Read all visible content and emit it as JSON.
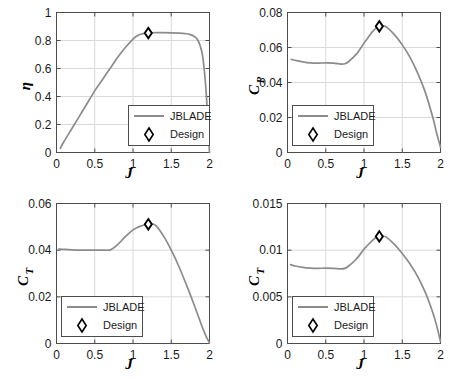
{
  "figure": {
    "title": "",
    "panel_count": 4,
    "series_color": "#8c8c8c",
    "marker_color": "#000000",
    "grid_color": "#d9d9d9",
    "axis_color": "#4d4d4d"
  },
  "legend": {
    "line_label": "JBLADE",
    "marker_label": "Design",
    "marker_icon": "diamond-icon",
    "line_icon": "line-swatch-icon"
  },
  "chart_data": [
    {
      "id": "panel-eta",
      "type": "line",
      "title": "",
      "xlabel": "J",
      "ylabel": "η",
      "ylabel_plain": "eta",
      "xlim": [
        0,
        2
      ],
      "ylim": [
        0,
        1
      ],
      "xticks": [
        0,
        0.5,
        1,
        1.5,
        2
      ],
      "xticklabels": [
        "0",
        "0.5",
        "1",
        "1.5",
        "2"
      ],
      "yticks": [
        0,
        0.2,
        0.4,
        0.6,
        0.8,
        1
      ],
      "yticklabels": [
        "0",
        "0.2",
        "0.4",
        "0.6",
        "0.8",
        "1"
      ],
      "grid": true,
      "legend_position": "lower right",
      "series": [
        {
          "name": "JBLADE",
          "x": [
            0.05,
            0.1,
            0.2,
            0.3,
            0.4,
            0.5,
            0.6,
            0.7,
            0.8,
            0.9,
            1.0,
            1.05,
            1.1,
            1.15,
            1.2,
            1.25,
            1.3,
            1.4,
            1.5,
            1.6,
            1.7,
            1.75,
            1.8,
            1.85,
            1.9,
            1.93,
            1.96,
            1.98,
            2.0
          ],
          "y": [
            0.03,
            0.08,
            0.17,
            0.26,
            0.35,
            0.44,
            0.52,
            0.6,
            0.68,
            0.75,
            0.81,
            0.832,
            0.845,
            0.851,
            0.853,
            0.855,
            0.856,
            0.856,
            0.855,
            0.853,
            0.848,
            0.842,
            0.83,
            0.8,
            0.72,
            0.6,
            0.4,
            0.2,
            0.0
          ]
        }
      ],
      "design_point": {
        "x": 1.2,
        "y": 0.853,
        "label": "Design"
      }
    },
    {
      "id": "panel-cp",
      "type": "line",
      "title": "",
      "xlabel": "J",
      "ylabel": "C_P",
      "ylabel_base": "C",
      "ylabel_sub": "P",
      "xlim": [
        0,
        2
      ],
      "ylim": [
        0,
        0.08
      ],
      "xticks": [
        0,
        0.5,
        1,
        1.5,
        2
      ],
      "xticklabels": [
        "0",
        "0.5",
        "1",
        "1.5",
        "2"
      ],
      "yticks": [
        0,
        0.02,
        0.04,
        0.06,
        0.08
      ],
      "yticklabels": [
        "0",
        "0.02",
        "0.04",
        "0.06",
        "0.08"
      ],
      "grid": true,
      "legend_position": "lower left",
      "series": [
        {
          "name": "JBLADE",
          "x": [
            0.05,
            0.1,
            0.2,
            0.3,
            0.4,
            0.5,
            0.6,
            0.7,
            0.75,
            0.8,
            0.9,
            1.0,
            1.05,
            1.1,
            1.15,
            1.2,
            1.25,
            1.3,
            1.4,
            1.5,
            1.6,
            1.7,
            1.8,
            1.9,
            1.95,
            2.0
          ],
          "y": [
            0.0532,
            0.0527,
            0.0518,
            0.0512,
            0.0511,
            0.0512,
            0.0511,
            0.0505,
            0.0507,
            0.052,
            0.0562,
            0.0625,
            0.0655,
            0.0685,
            0.0708,
            0.0721,
            0.0724,
            0.0715,
            0.0672,
            0.0615,
            0.0545,
            0.0455,
            0.0345,
            0.02,
            0.011,
            0.003
          ]
        }
      ],
      "design_point": {
        "x": 1.2,
        "y": 0.0721,
        "label": "Design"
      }
    },
    {
      "id": "panel-ct-left",
      "type": "line",
      "title": "",
      "xlabel": "J",
      "ylabel": "C_T",
      "ylabel_base": "C",
      "ylabel_sub": "T",
      "xlim": [
        0,
        2
      ],
      "ylim": [
        0,
        0.06
      ],
      "xticks": [
        0,
        0.5,
        1,
        1.5,
        2
      ],
      "xticklabels": [
        "0",
        "0.5",
        "1",
        "1.5",
        "2"
      ],
      "yticks": [
        0,
        0.02,
        0.04,
        0.06
      ],
      "yticklabels": [
        "0",
        "0.02",
        "0.04",
        "0.06"
      ],
      "grid": true,
      "legend_position": "lower left",
      "series": [
        {
          "name": "JBLADE",
          "x": [
            0.03,
            0.1,
            0.2,
            0.3,
            0.4,
            0.5,
            0.6,
            0.68,
            0.72,
            0.8,
            0.9,
            1.0,
            1.05,
            1.1,
            1.15,
            1.2,
            1.25,
            1.3,
            1.4,
            1.5,
            1.6,
            1.7,
            1.8,
            1.9,
            1.95,
            2.0
          ],
          "y": [
            0.0405,
            0.0403,
            0.0401,
            0.04,
            0.04,
            0.04,
            0.04,
            0.04,
            0.0404,
            0.0424,
            0.0458,
            0.0487,
            0.0496,
            0.0503,
            0.0508,
            0.0511,
            0.0512,
            0.0505,
            0.046,
            0.04,
            0.033,
            0.025,
            0.0165,
            0.0075,
            0.0035,
            0.0002
          ]
        }
      ],
      "design_point": {
        "x": 1.2,
        "y": 0.0511,
        "label": "Design"
      }
    },
    {
      "id": "panel-ct-right",
      "type": "line",
      "title": "",
      "xlabel": "J",
      "ylabel": "C_T",
      "ylabel_base": "C",
      "ylabel_sub": "T",
      "xlim": [
        0,
        2
      ],
      "ylim": [
        0,
        0.015
      ],
      "xticks": [
        0,
        0.5,
        1,
        1.5,
        2
      ],
      "xticklabels": [
        "0",
        "0.5",
        "1",
        "1.5",
        "2"
      ],
      "yticks": [
        0,
        0.005,
        0.01,
        0.015
      ],
      "yticklabels": [
        "0",
        "0.005",
        "0.01",
        "0.015"
      ],
      "grid": true,
      "legend_position": "lower left",
      "series": [
        {
          "name": "JBLADE",
          "x": [
            0.04,
            0.1,
            0.2,
            0.3,
            0.4,
            0.5,
            0.6,
            0.7,
            0.75,
            0.8,
            0.9,
            1.0,
            1.05,
            1.1,
            1.15,
            1.2,
            1.25,
            1.3,
            1.4,
            1.5,
            1.6,
            1.7,
            1.8,
            1.9,
            1.95,
            2.0
          ],
          "y": [
            0.00845,
            0.0083,
            0.00815,
            0.00807,
            0.00805,
            0.00807,
            0.00805,
            0.008,
            0.00805,
            0.0083,
            0.00905,
            0.0101,
            0.01055,
            0.01098,
            0.0113,
            0.01147,
            0.0115,
            0.01135,
            0.0106,
            0.00965,
            0.00855,
            0.0072,
            0.0055,
            0.0033,
            0.0019,
            0.0002
          ]
        }
      ],
      "design_point": {
        "x": 1.2,
        "y": 0.01147,
        "label": "Design"
      }
    }
  ]
}
